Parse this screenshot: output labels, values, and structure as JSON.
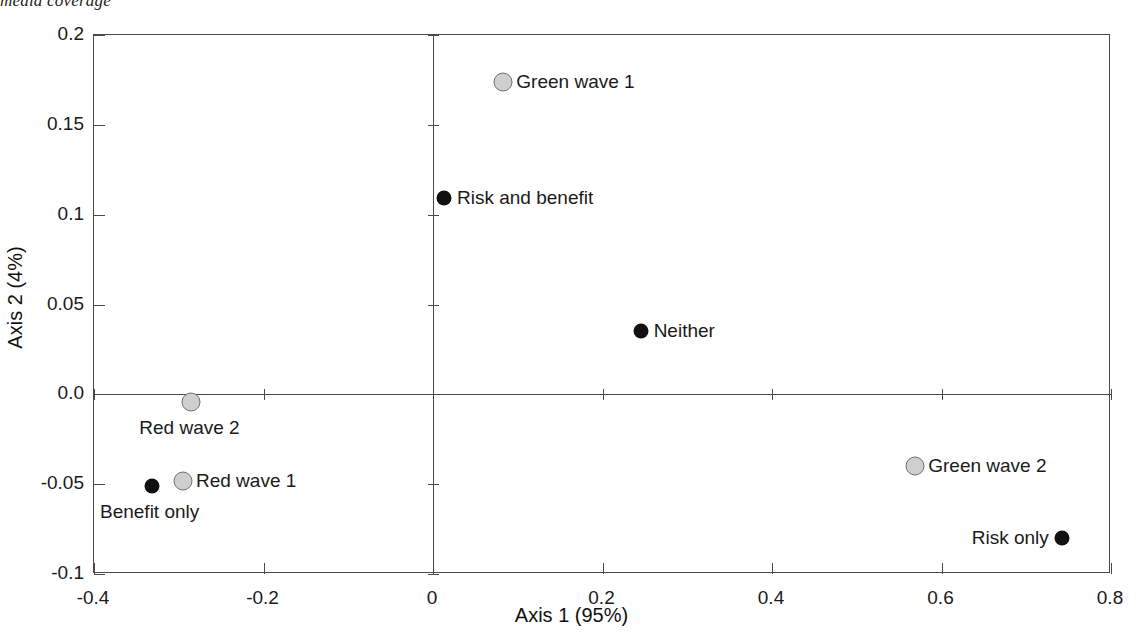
{
  "caption": "media coverage",
  "chart_data": {
    "type": "scatter",
    "title": "",
    "xlabel": "Axis 1 (95%)",
    "ylabel": "Axis 2 (4%)",
    "xlim": [
      -0.4,
      0.8
    ],
    "ylim": [
      -0.1,
      0.2
    ],
    "xticks": [
      "-0.4",
      "-0.2",
      "0",
      "0.2",
      "0.4",
      "0.6",
      "0.8"
    ],
    "xtick_values": [
      -0.4,
      -0.2,
      0,
      0.2,
      0.4,
      0.6,
      0.8
    ],
    "yticks": [
      "0.2",
      "0.15",
      "0.1",
      "0.05",
      "0.0",
      "-0.05",
      "-0.1"
    ],
    "ytick_values": [
      0.2,
      0.15,
      0.1,
      0.05,
      0.0,
      -0.05,
      -0.1
    ],
    "grid": false,
    "legend": "none",
    "origin_lines": true,
    "marker_styles": {
      "hollow": {
        "fill": "#cfcfcf",
        "stroke": "#6d6d6d",
        "name": "wave"
      },
      "filled": {
        "fill": "#111111",
        "stroke": "#111111",
        "name": "frame"
      }
    },
    "points": [
      {
        "label": "Green wave 1",
        "x": 0.083,
        "y": 0.174,
        "style": "hollow",
        "label_pos": "right"
      },
      {
        "label": "Risk and benefit",
        "x": 0.013,
        "y": 0.109,
        "style": "filled",
        "label_pos": "right"
      },
      {
        "label": "Neither",
        "x": 0.245,
        "y": 0.035,
        "style": "filled",
        "label_pos": "right"
      },
      {
        "label": "Red wave 2",
        "x": -0.285,
        "y": -0.004,
        "style": "hollow",
        "label_pos": "below"
      },
      {
        "label": "Red wave 1",
        "x": -0.295,
        "y": -0.048,
        "style": "hollow",
        "label_pos": "right"
      },
      {
        "label": "Benefit only",
        "x": -0.332,
        "y": -0.051,
        "style": "filled",
        "label_pos": "below"
      },
      {
        "label": "Green wave 2",
        "x": 0.569,
        "y": -0.04,
        "style": "hollow",
        "label_pos": "right"
      },
      {
        "label": "Risk only",
        "x": 0.742,
        "y": -0.08,
        "style": "filled",
        "label_pos": "left"
      }
    ]
  }
}
